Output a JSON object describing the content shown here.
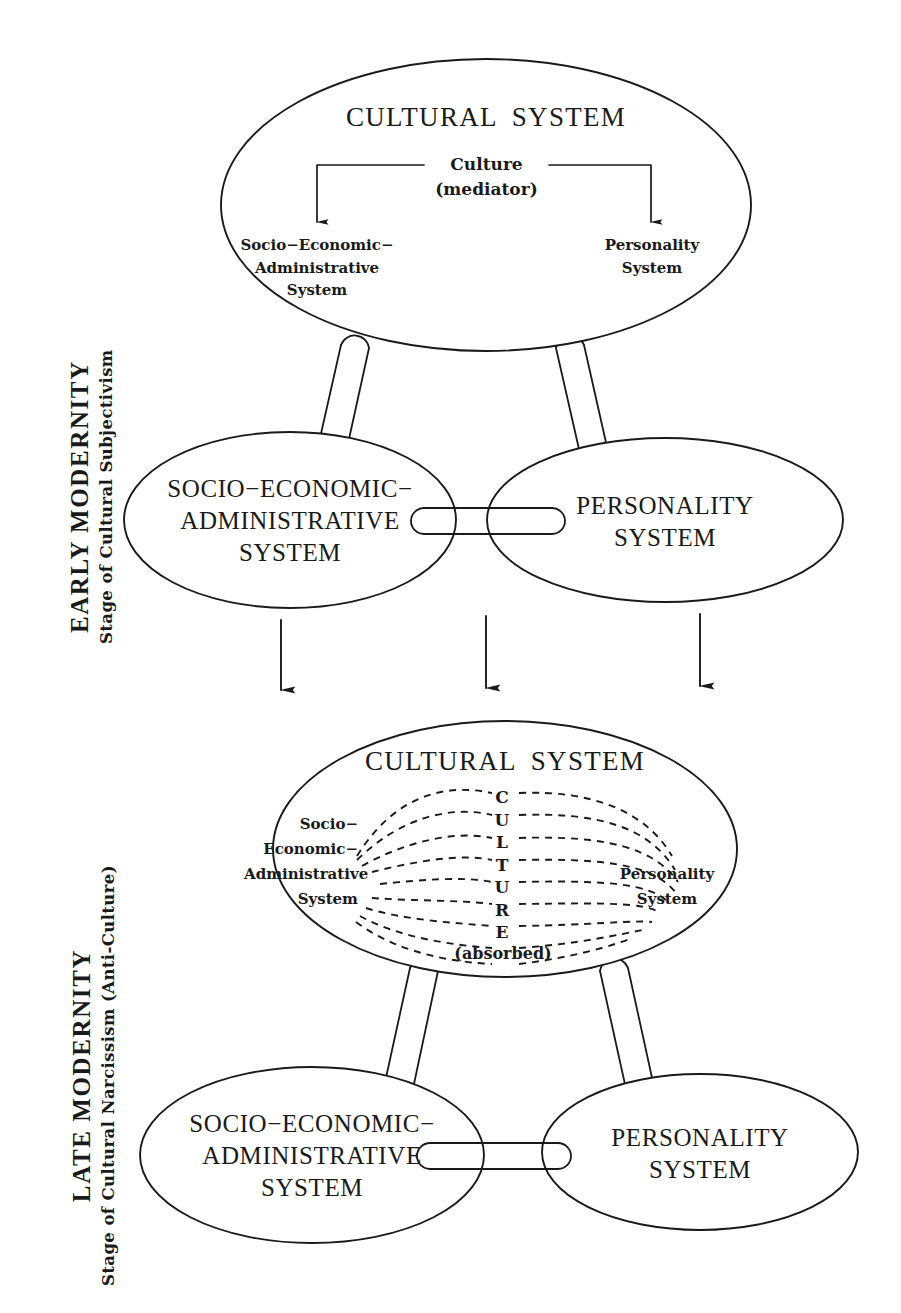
{
  "diagram": {
    "stroke_color": "#1a1a1a",
    "background_color": "#ffffff"
  },
  "sections": [
    {
      "id": "early-modernity",
      "heading": "EARLY  MODERNITY",
      "subheading": "Stage of Cultural Subjectivism"
    },
    {
      "id": "late-modernity",
      "heading": "LATE  MODERNITY",
      "subheading": "Stage of Cultural Narcissism (Anti-Culture)"
    }
  ],
  "early": {
    "cultural_system": {
      "title_word1": "CULTURAL",
      "title_word2": "SYSTEM",
      "mediator_line1": "Culture",
      "mediator_line2": "(mediator)",
      "inner_left": [
        "Socio−Economic−",
        "Administrative",
        "System"
      ],
      "inner_right": [
        "Personality",
        "System"
      ]
    },
    "socio_node": [
      "SOCIO−ECONOMIC−",
      "ADMINISTRATIVE",
      "SYSTEM"
    ],
    "personality_node": [
      "PERSONALITY",
      "SYSTEM"
    ]
  },
  "late": {
    "cultural_system": {
      "title_word1": "CULTURAL",
      "title_word2": "SYSTEM",
      "culture_letters": [
        "C",
        "U",
        "L",
        "T",
        "U",
        "R",
        "E"
      ],
      "absorbed_note": "(absorbed)",
      "inner_left": [
        "Socio−",
        "Economic−",
        "Administrative",
        "System"
      ],
      "inner_right": [
        "Personality",
        "System"
      ]
    },
    "socio_node": [
      "SOCIO−ECONOMIC−",
      "ADMINISTRATIVE",
      "SYSTEM"
    ],
    "personality_node": [
      "PERSONALITY",
      "SYSTEM"
    ]
  },
  "transition_arrows": {
    "count": 3,
    "direction": "down"
  }
}
